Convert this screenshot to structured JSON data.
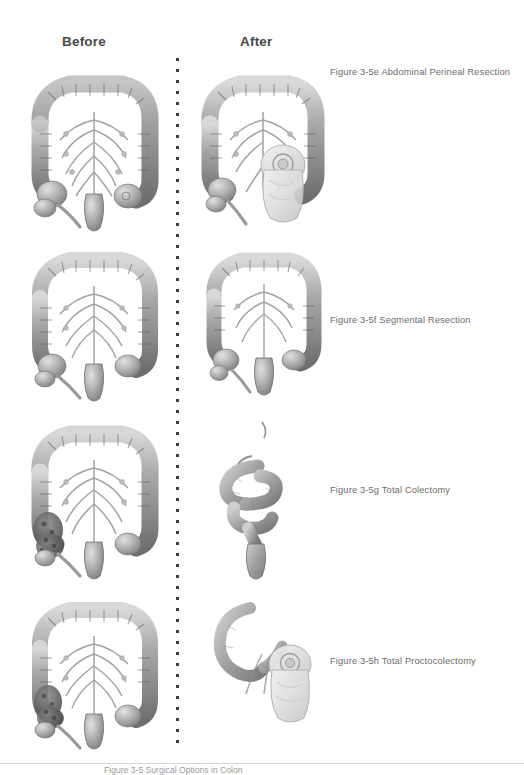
{
  "page": {
    "background_color": "#ffffff",
    "width": 524,
    "height": 775
  },
  "headers": {
    "before": "Before",
    "after": "After",
    "color": "#4a4a4a"
  },
  "divider": {
    "style": "vertical-dotted",
    "dot_color": "#3d3d3d",
    "dot_spacing_px": 11
  },
  "rows": [
    {
      "id": "3-5e",
      "caption": "Figure 3-5e Abdominal Perineal Resection",
      "before": {
        "illustration": "colon-with-mesentery-intact",
        "alt": "Grayscale anatomical illustration of full colon with mesenteric vessels, cecum, appendix and rectum intact"
      },
      "after": {
        "illustration": "colon-with-colostomy-bag",
        "alt": "Colon after abdominoperineal resection with rectum removed and a colostomy pouch attached at lower left quadrant",
        "has_ostomy_bag": true
      }
    },
    {
      "id": "3-5f",
      "caption": "Figure 3-5f Segmental Resection",
      "before": {
        "illustration": "colon-with-mesentery-intact",
        "alt": "Grayscale anatomical illustration of full colon with mesenteric vessels and rectum"
      },
      "after": {
        "illustration": "colon-shortened-anastomosis",
        "alt": "Colon after segmental resection, shortened with anastomosis, remaining continuous to rectum",
        "has_ostomy_bag": false
      }
    },
    {
      "id": "3-5g",
      "caption": "Figure 3-5g Total Colectomy",
      "before": {
        "illustration": "colon-diseased-cecum",
        "alt": "Colon illustration with darkened mottled diseased segments at cecum and ascending colon",
        "has_lesions": true
      },
      "after": {
        "illustration": "small-bowel-to-rectum",
        "alt": "After total colectomy only small bowel loops remain anastomosed to the rectal stump",
        "has_ostomy_bag": false
      }
    },
    {
      "id": "3-5h",
      "caption": "Figure 3-5h Total Proctocolectomy",
      "before": {
        "illustration": "colon-diseased-cecum",
        "alt": "Colon illustration with darkened mottled diseased segments at cecum and lower colon",
        "has_lesions": true
      },
      "after": {
        "illustration": "ileostomy-with-bag",
        "alt": "After total proctocolectomy, small bowel brought out as ileostomy with pouch attached",
        "has_ostomy_bag": true
      }
    }
  ],
  "footer": {
    "rule_color": "#d8d8d8",
    "clipped_caption": "Figure 3-5 Surgical Options in Colon"
  }
}
